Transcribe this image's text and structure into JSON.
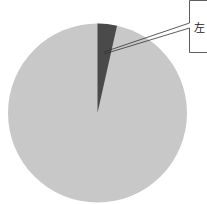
{
  "chart_data": {
    "type": "pie",
    "title": "",
    "slices": [
      {
        "label": "左",
        "value": 3.5,
        "color": "#4a4a4a"
      },
      {
        "label": "",
        "value": 96.5,
        "color": "#c8c8c8"
      }
    ],
    "start_angle_deg": 0,
    "direction": "clockwise",
    "annotations": [
      {
        "text_lines": [
          "…",
          "左…"
        ],
        "target_slice": 0,
        "position": "top-right"
      }
    ]
  },
  "callout": {
    "line1": "",
    "line2": "左"
  }
}
